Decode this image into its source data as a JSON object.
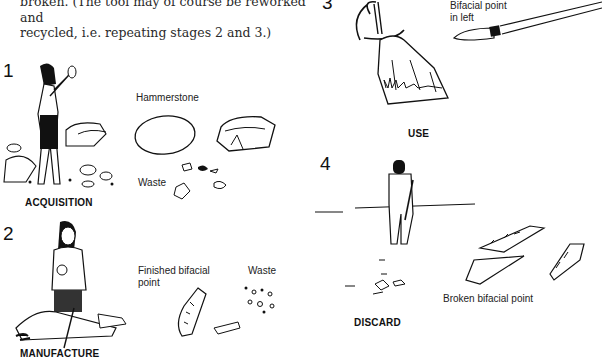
{
  "intro_text": {
    "line1": "broken. (The tool may of course be reworked and",
    "line2": "recycled, i.e. repeating stages 2 and 3.)"
  },
  "stages": [
    {
      "number": "1",
      "title": "ACQUISITION",
      "labels": [
        "Hammerstone",
        "Waste"
      ]
    },
    {
      "number": "2",
      "title": "MANUFACTURE",
      "labels": [
        "Finished bifacial point",
        "Waste"
      ]
    },
    {
      "number": "3",
      "title": "USE",
      "labels": [
        "Bifacial point in left"
      ]
    },
    {
      "number": "4",
      "title": "DISCARD",
      "labels": [
        "Broken bifacial point"
      ]
    }
  ],
  "labels": {
    "hammerstone": "Hammerstone",
    "waste1": "Waste",
    "finished_line1": "Finished bifacial",
    "finished_line2": "point",
    "waste2": "Waste",
    "bifacial_line1": "Bifacial point",
    "bifacial_line2": "in left",
    "broken": "Broken bifacial point"
  }
}
